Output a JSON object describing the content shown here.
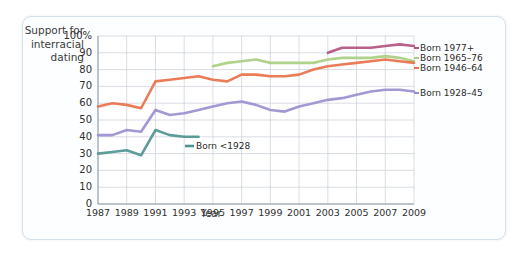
{
  "chart_data": {
    "type": "line",
    "title": "",
    "xlabel": "Year",
    "ylabel": "Support for interracial dating",
    "x": [
      1987,
      1988,
      1989,
      1990,
      1991,
      1992,
      1993,
      1994,
      1995,
      1996,
      1997,
      1998,
      1999,
      2000,
      2001,
      2002,
      2003,
      2004,
      2005,
      2006,
      2007,
      2008,
      2009
    ],
    "xticks": [
      "1987",
      "1989",
      "1991",
      "1993",
      "1995",
      "1997",
      "1999",
      "2001",
      "2003",
      "2005",
      "2007",
      "2009"
    ],
    "yticks": [
      "100%",
      "90",
      "80",
      "70",
      "60",
      "50",
      "40",
      "30",
      "20",
      "10",
      "0"
    ],
    "ylim": [
      0,
      100
    ],
    "xlim": [
      1987,
      2009
    ],
    "grid": true,
    "legend_position": "right",
    "series": [
      {
        "name": "Born 1977+",
        "color": "#b4547f",
        "x": [
          2003,
          2004,
          2005,
          2006,
          2007,
          2008,
          2009
        ],
        "values": [
          90,
          93,
          93,
          93,
          94,
          95,
          94
        ]
      },
      {
        "name": "Born 1965–76",
        "color": "#a8cf80",
        "x": [
          1995,
          1996,
          1997,
          1998,
          1999,
          2000,
          2001,
          2002,
          2003,
          2004,
          2005,
          2006,
          2007,
          2008,
          2009
        ],
        "values": [
          82,
          84,
          85,
          86,
          84,
          84,
          84,
          84,
          86,
          87,
          87,
          87,
          88,
          87,
          85
        ]
      },
      {
        "name": "Born 1946–64",
        "color": "#e8714a",
        "x": [
          1987,
          1988,
          1989,
          1990,
          1991,
          1992,
          1993,
          1994,
          1995,
          1996,
          1997,
          1998,
          1999,
          2000,
          2001,
          2002,
          2003,
          2004,
          2005,
          2006,
          2007,
          2008,
          2009
        ],
        "values": [
          58,
          60,
          59,
          57,
          73,
          74,
          75,
          76,
          74,
          73,
          77,
          77,
          76,
          76,
          77,
          80,
          82,
          83,
          84,
          85,
          86,
          85,
          84
        ]
      },
      {
        "name": "Born 1928–45",
        "color": "#9a8fd0",
        "x": [
          1987,
          1988,
          1989,
          1990,
          1991,
          1992,
          1993,
          1994,
          1995,
          1996,
          1997,
          1998,
          1999,
          2000,
          2001,
          2002,
          2003,
          2004,
          2005,
          2006,
          2007,
          2008,
          2009
        ],
        "values": [
          41,
          41,
          44,
          43,
          56,
          53,
          54,
          56,
          58,
          60,
          61,
          59,
          56,
          55,
          58,
          60,
          62,
          63,
          65,
          67,
          68,
          68,
          67
        ]
      },
      {
        "name": "Born <1928",
        "color": "#4e9490",
        "x": [
          1987,
          1988,
          1989,
          1990,
          1991,
          1992,
          1993,
          1994
        ],
        "values": [
          30,
          31,
          32,
          29,
          44,
          41,
          40,
          40
        ]
      }
    ],
    "right_labels": [
      {
        "name": "Born 1977+",
        "color": "#b4547f"
      },
      {
        "name": "Born 1965–76",
        "color": "#a8cf80"
      },
      {
        "name": "Born 1946–64",
        "color": "#e8714a"
      },
      {
        "name": "Born 1928–45",
        "color": "#9a8fd0"
      }
    ],
    "inline_label": {
      "name": "Born <1928",
      "color": "#4e9490"
    }
  }
}
